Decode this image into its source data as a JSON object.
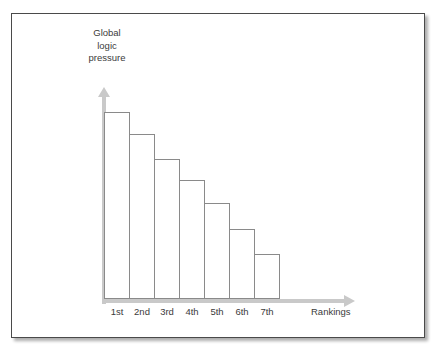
{
  "chart_data": {
    "type": "bar",
    "title": "",
    "categories": [
      "1st",
      "2nd",
      "3rd",
      "4th",
      "5th",
      "6th",
      "7th"
    ],
    "values": [
      196,
      173,
      147,
      125,
      101,
      73,
      47
    ],
    "ylabel_lines": [
      "Global",
      "logic",
      "pressure"
    ],
    "ylabel": "Global logic pressure",
    "xlabel": "Rankings",
    "ylim": [
      0,
      210
    ],
    "grid": false,
    "legend": null,
    "bar_style": {
      "fill": "#ffffff",
      "outline": "#8a8a8a"
    },
    "axis_color": "#c9c9c9",
    "text_color": "#3b3b3b"
  },
  "frame": {
    "border_color": "#4a4a4a",
    "background": "#ffffff"
  }
}
